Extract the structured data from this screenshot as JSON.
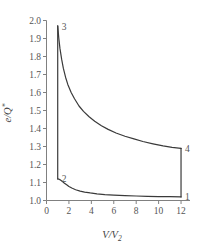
{
  "chart_data": {
    "type": "line",
    "title": "",
    "xlabel": "V/V2",
    "ylabel": "e/Q*",
    "xlabel_parts": {
      "lead": "V/V",
      "sub": "2"
    },
    "ylabel_parts": {
      "lead": "e/Q",
      "sup": "*"
    },
    "xlim": [
      0,
      12.8
    ],
    "ylim": [
      1.0,
      2.0
    ],
    "xticks": [
      0,
      2,
      4,
      6,
      8,
      10,
      12
    ],
    "xtick_labels": [
      "0",
      "2",
      "4",
      "6",
      "8",
      "10",
      "12"
    ],
    "yticks": [
      1.0,
      1.1,
      1.2,
      1.3,
      1.4,
      1.5,
      1.6,
      1.7,
      1.8,
      1.9,
      2.0
    ],
    "ytick_labels": [
      "1.0",
      "1.1",
      "1.2",
      "1.3",
      "1.4",
      "1.5",
      "1.6",
      "1.7",
      "1.8",
      "1.9",
      "2.0"
    ],
    "grid": false,
    "legend": "none",
    "line_color": "#3a3a3a",
    "axis_color": "#808080",
    "state_points": [
      {
        "label": "1",
        "x": 12.0,
        "y": 1.02
      },
      {
        "label": "2",
        "x": 1.0,
        "y": 1.12
      },
      {
        "label": "3",
        "x": 1.0,
        "y": 1.97
      },
      {
        "label": "4",
        "x": 12.0,
        "y": 1.29
      }
    ],
    "series": [
      {
        "name": "2-3 isochoric heating",
        "points": [
          [
            1.0,
            1.12
          ],
          [
            1.0,
            1.97
          ]
        ]
      },
      {
        "name": "3-4 expansion",
        "points": [
          [
            1.0,
            1.97
          ],
          [
            1.1,
            1.9
          ],
          [
            1.2,
            1.845
          ],
          [
            1.35,
            1.785
          ],
          [
            1.5,
            1.735
          ],
          [
            1.7,
            1.685
          ],
          [
            1.9,
            1.645
          ],
          [
            2.2,
            1.6
          ],
          [
            2.5,
            1.565
          ],
          [
            2.9,
            1.525
          ],
          [
            3.3,
            1.495
          ],
          [
            3.8,
            1.465
          ],
          [
            4.3,
            1.44
          ],
          [
            4.9,
            1.415
          ],
          [
            5.5,
            1.395
          ],
          [
            6.2,
            1.375
          ],
          [
            7.0,
            1.357
          ],
          [
            7.8,
            1.342
          ],
          [
            8.6,
            1.328
          ],
          [
            9.5,
            1.315
          ],
          [
            10.4,
            1.303
          ],
          [
            11.2,
            1.295
          ],
          [
            12.0,
            1.29
          ]
        ]
      },
      {
        "name": "4-1 isochoric cooling",
        "points": [
          [
            12.0,
            1.29
          ],
          [
            12.0,
            1.02
          ]
        ]
      },
      {
        "name": "1-2 compression",
        "points": [
          [
            12.0,
            1.02
          ],
          [
            11.0,
            1.021
          ],
          [
            10.0,
            1.022
          ],
          [
            9.0,
            1.023
          ],
          [
            8.0,
            1.025
          ],
          [
            7.0,
            1.027
          ],
          [
            6.0,
            1.03
          ],
          [
            5.2,
            1.033
          ],
          [
            4.5,
            1.037
          ],
          [
            3.9,
            1.042
          ],
          [
            3.4,
            1.047
          ],
          [
            3.0,
            1.052
          ],
          [
            2.6,
            1.06
          ],
          [
            2.3,
            1.068
          ],
          [
            2.0,
            1.078
          ],
          [
            1.8,
            1.087
          ],
          [
            1.6,
            1.096
          ],
          [
            1.45,
            1.104
          ],
          [
            1.3,
            1.111
          ],
          [
            1.18,
            1.116
          ],
          [
            1.08,
            1.119
          ],
          [
            1.0,
            1.12
          ]
        ]
      }
    ]
  }
}
